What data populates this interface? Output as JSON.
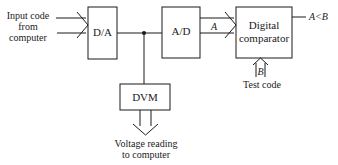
{
  "diagram": {
    "input_label": [
      "Input code",
      "from",
      "computer"
    ],
    "blocks": {
      "da": "D/A",
      "ad": "A/D",
      "comparator": [
        "Digital",
        "comparator"
      ],
      "dvm": "DVM"
    },
    "signals": {
      "a_bus": "A",
      "b_bus": "B",
      "output": "A<B"
    },
    "test_code_label": "Test code",
    "voltage_label": [
      "Voltage reading",
      "to computer"
    ],
    "colors": {
      "line": "#1a1a1a",
      "background": "#ffffff"
    }
  }
}
